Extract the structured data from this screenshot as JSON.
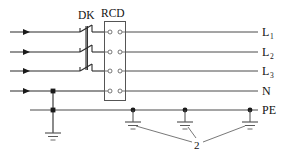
{
  "diagram": {
    "devices": [
      {
        "id": "dk",
        "label": "DK",
        "type": "switch-disconnector",
        "poles": 3
      },
      {
        "id": "rcd",
        "label": "RCD",
        "type": "residual-current-device",
        "poles": 4
      }
    ],
    "conductor_labels": [
      {
        "id": "l1",
        "text": "L",
        "subscript": "1"
      },
      {
        "id": "l2",
        "text": "L",
        "subscript": "2"
      },
      {
        "id": "l3",
        "text": "L",
        "subscript": "3"
      },
      {
        "id": "n",
        "text": "N",
        "subscript": ""
      },
      {
        "id": "pe",
        "text": "PE",
        "subscript": ""
      }
    ],
    "annotations": [
      {
        "id": "earth-callout",
        "text": "2"
      }
    ],
    "earth_electrodes": {
      "count": 4,
      "callout_label": "2"
    },
    "colors": {
      "wire": "#4a4a4a",
      "wire_dark": "#2b2b2b",
      "outline": "#555555",
      "junction": "#1a1a1a",
      "text": "#111111",
      "background": "#ffffff"
    }
  }
}
